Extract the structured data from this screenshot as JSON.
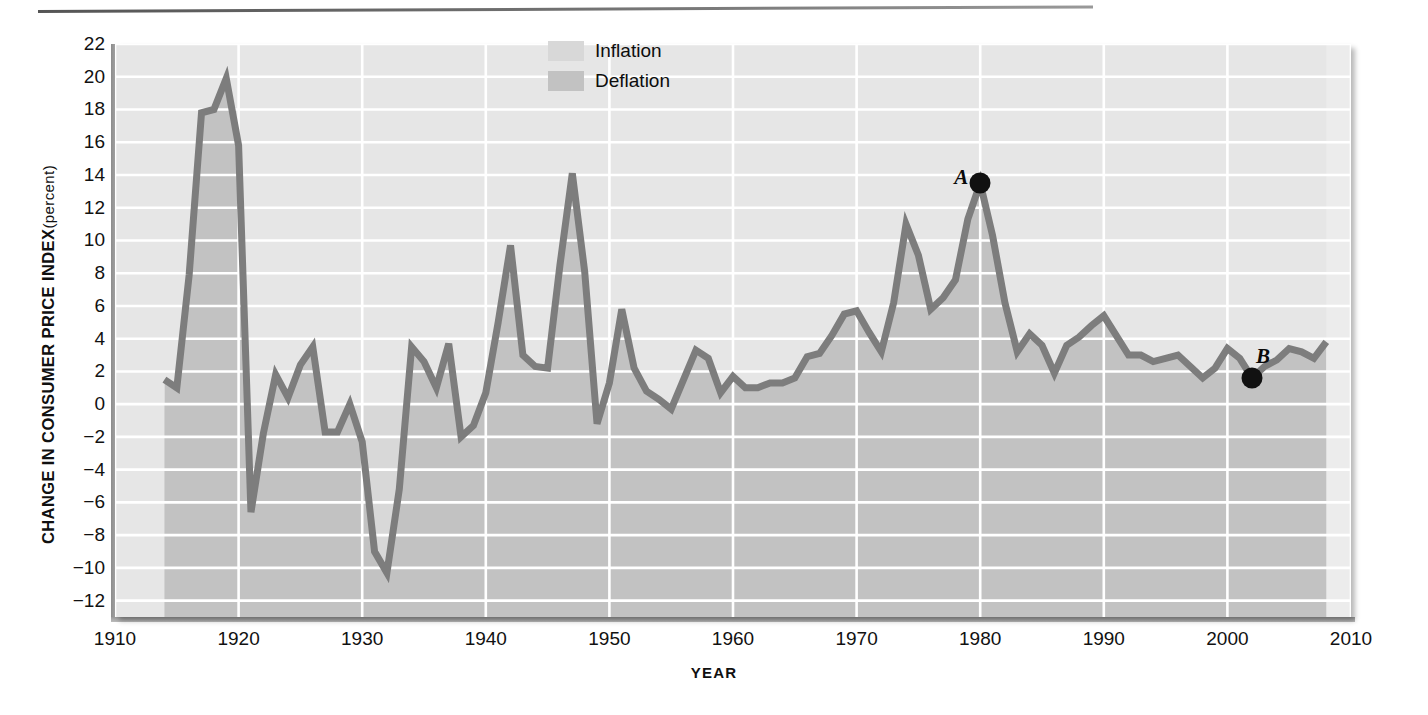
{
  "axis": {
    "y_title_main": "CHANGE  IN CONSUMER PRICE  INDEX",
    "y_title_unit": "(percent)",
    "x_title": "YEAR"
  },
  "legend": {
    "items": [
      {
        "label": "Inflation",
        "color": "#d8d8d8"
      },
      {
        "label": "Deflation",
        "color": "#c2c2c2"
      }
    ]
  },
  "annotations": [
    {
      "name": "A",
      "year": 1980,
      "value": 13.5
    },
    {
      "name": "B",
      "year": 2002,
      "value": 1.6
    }
  ],
  "colors": {
    "plot_background": "#e6e6e6",
    "inflation_fill": "#d8d8d8",
    "deflation_fill": "#c2c2c2",
    "line": "#7d7d7d",
    "gridline": "#ffffff",
    "axis": "#9a9a9a",
    "text": "#111111"
  },
  "chart_data": {
    "type": "area",
    "title": "",
    "subtitle": "",
    "xlabel": "YEAR",
    "ylabel": "CHANGE IN CONSUMER PRICE INDEX (percent)",
    "xlim": [
      1910,
      2010
    ],
    "ylim": [
      -13,
      22
    ],
    "xticks": [
      1910,
      1920,
      1930,
      1940,
      1950,
      1960,
      1970,
      1980,
      1990,
      2000,
      2010
    ],
    "yticks": [
      22,
      20,
      18,
      16,
      14,
      12,
      10,
      8,
      6,
      4,
      2,
      0,
      -2,
      -4,
      -6,
      -8,
      -10,
      -12
    ],
    "grid": true,
    "legend_position": "top-center",
    "baseline": 0,
    "series": [
      {
        "name": "Change in Consumer Price Index",
        "x": [
          1914,
          1915,
          1916,
          1917,
          1918,
          1919,
          1920,
          1921,
          1922,
          1923,
          1924,
          1925,
          1926,
          1927,
          1928,
          1929,
          1930,
          1931,
          1932,
          1933,
          1934,
          1935,
          1936,
          1937,
          1938,
          1939,
          1940,
          1941,
          1942,
          1943,
          1944,
          1945,
          1946,
          1947,
          1948,
          1949,
          1950,
          1951,
          1952,
          1953,
          1954,
          1955,
          1956,
          1957,
          1958,
          1959,
          1960,
          1961,
          1962,
          1963,
          1964,
          1965,
          1966,
          1967,
          1968,
          1969,
          1970,
          1971,
          1972,
          1973,
          1974,
          1975,
          1976,
          1977,
          1978,
          1979,
          1980,
          1981,
          1982,
          1983,
          1984,
          1985,
          1986,
          1987,
          1988,
          1989,
          1990,
          1991,
          1992,
          1993,
          1994,
          1995,
          1996,
          1997,
          1998,
          1999,
          2000,
          2001,
          2002,
          2003,
          2004,
          2005,
          2006,
          2007,
          2008
        ],
        "y": [
          1.5,
          1.0,
          7.9,
          17.8,
          18.0,
          19.9,
          15.8,
          -6.6,
          -1.8,
          1.8,
          0.4,
          2.4,
          3.5,
          -1.7,
          -1.7,
          0.0,
          -2.3,
          -9.0,
          -10.3,
          -5.2,
          3.5,
          2.6,
          1.0,
          3.7,
          -2.0,
          -1.3,
          0.7,
          5.0,
          9.7,
          3.0,
          2.3,
          2.2,
          8.5,
          14.1,
          8.1,
          -1.2,
          1.3,
          5.8,
          2.2,
          0.8,
          0.3,
          -0.3,
          1.5,
          3.3,
          2.8,
          0.7,
          1.7,
          1.0,
          1.0,
          1.3,
          1.3,
          1.6,
          2.9,
          3.1,
          4.2,
          5.5,
          5.7,
          4.4,
          3.2,
          6.2,
          11.0,
          9.1,
          5.8,
          6.5,
          7.6,
          11.3,
          13.5,
          10.3,
          6.2,
          3.2,
          4.3,
          3.6,
          1.9,
          3.6,
          4.1,
          4.8,
          5.4,
          4.2,
          3.0,
          3.0,
          2.6,
          2.8,
          3.0,
          2.3,
          1.6,
          2.2,
          3.4,
          2.8,
          1.6,
          2.3,
          2.7,
          3.4,
          3.2,
          2.8,
          3.8
        ]
      }
    ]
  },
  "notes": {
    "inflation_description": "Region above the zero line (positive change)",
    "deflation_description": "Region below the zero line (negative change)"
  }
}
